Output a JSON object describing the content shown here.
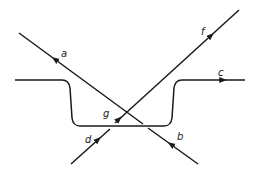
{
  "diagram": {
    "labels": {
      "a": "a",
      "b": "b",
      "c": "c",
      "d": "d",
      "f": "f",
      "g": "g"
    },
    "colors": {
      "stroke": "#1a1a1a",
      "background": "#ffffff"
    }
  }
}
